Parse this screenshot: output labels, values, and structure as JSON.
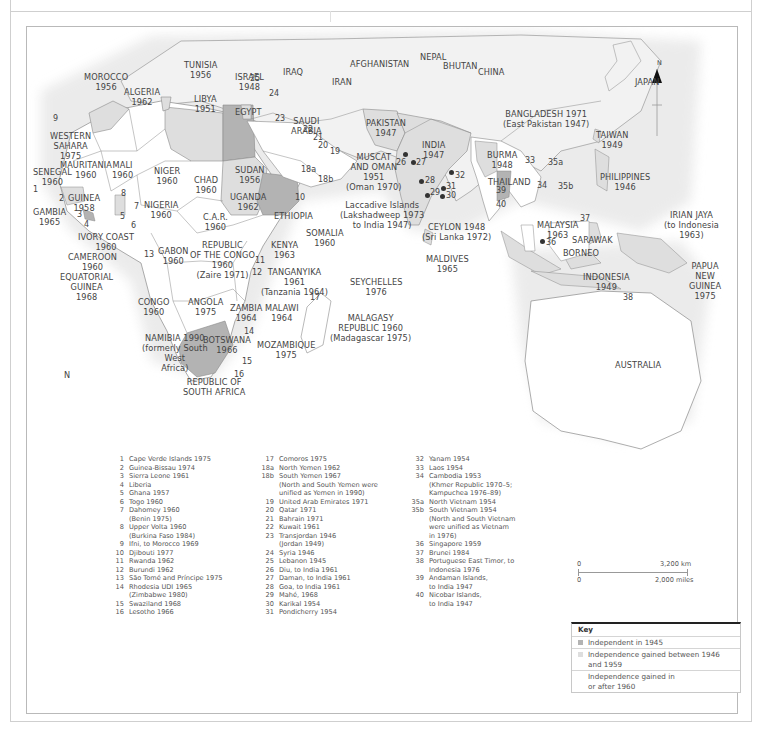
{
  "colors": {
    "independent_1945": "#b3b3b3",
    "independent_1946_1959": "#dedede",
    "independent_1960_after": "#ffffff",
    "sea": "#ffffff",
    "land_other": "#f1f1f1",
    "border": "#8a8a8a"
  },
  "compass": {
    "label": "N",
    "icon": "north-arrow-icon"
  },
  "map_labels": {
    "tunisia": "TUNISIA\n1956",
    "morocco": "MOROCCO\n1956",
    "algeria": "ALGERIA\n1962",
    "libya": "LIBYA\n1951",
    "egypt": "EGYPT",
    "israel": "ISRAEL\n1948",
    "iraq": "IRAQ",
    "iran": "IRAN",
    "afghanistan": "AFGHANISTAN",
    "nepal": "NEPAL",
    "bhutan": "BHUTAN",
    "china": "CHINA",
    "japan": "JAPAN",
    "pakistan": "PAKISTAN\n1947",
    "india": "INDIA\n1947",
    "bangladesh": "BANGLADESH 1971\n(East Pakistan 1947)",
    "taiwan": "TAIWAN\n1949",
    "burma": "BURMA\n1948",
    "thailand": "THAILAND",
    "philippines": "PHILIPPINES\n1946",
    "western_sahara": "WESTERN\nSAHARA\n1975",
    "mauritania": "MAURITANIA\n1960",
    "mali": "MALI\n1960",
    "niger": "NIGER\n1960",
    "chad": "CHAD\n1960",
    "sudan": "SUDAN\n1956",
    "saudi_arabia": "SAUDI\nARABIA",
    "muscat_oman": "MUSCAT\nAND OMAN\n1951\n(Oman 1970)",
    "senegal": "SENEGAL\n1960",
    "gambia": "GAMBIA\n1965",
    "guinea": "GUINEA\n1958",
    "nigeria": "NIGERIA\n1960",
    "uganda": "UGANDA\n1962",
    "ethiopia": "ETHIOPIA",
    "car": "C.A.R.\n1960",
    "ivory_coast": "IVORY COAST\n1960",
    "cameroon": "CAMEROON\n1960",
    "equatorial_guinea": "EQUATORIAL\nGUINEA\n1968",
    "gabon": "GABON\n1960",
    "rep_congo": "REPUBLIC\nOF THE CONGO\n1960\n(Zaire 1971)",
    "somalia": "SOMALIA\n1960",
    "kenya": "KENYA\n1963",
    "tanganyika": "TANGANYIKA\n1961\n(Tanzania 1964)",
    "laccadive": "Laccadive Islands\n(Lakshadweep 1973\nto India 1947)",
    "ceylon": "CEYLON 1948\n(Sri Lanka 1972)",
    "maldives": "MALDIVES\n1965",
    "seychelles": "SEYCHELLES\n1976",
    "malaysia": "MALAYSIA\n1963",
    "sarawak": "SARAWAK",
    "borneo": "BORNEO",
    "irian_jaya": "IRIAN JAYA\n(to Indonesia\n1963)",
    "papua": "PAPUA\nNEW\nGUINEA\n1975",
    "indonesia": "INDONESIA\n1949",
    "congo": "CONGO\n1960",
    "angola": "ANGOLA\n1975",
    "zambia": "ZAMBIA\n1964",
    "malawi": "MALAWI\n1964",
    "malagasy": "MALAGASY\nREPUBLIC 1960\n(Madagascar 1975)",
    "namibia": "NAMIBIA 1990\n(formerly South\nWest\nAfrica)",
    "botswana": "BOTSWANA\n1966",
    "mozambique": "MOZAMBIQUE\n1975",
    "south_africa": "REPUBLIC OF\nSOUTH AFRICA",
    "australia": "AUSTRALIA",
    "ocean_n": "N"
  },
  "map_numbers": [
    "1",
    "2",
    "3",
    "4",
    "5",
    "6",
    "7",
    "8",
    "9",
    "10",
    "11",
    "12",
    "13",
    "14",
    "15",
    "16",
    "17",
    "18a",
    "18b",
    "19",
    "20",
    "21",
    "22",
    "23",
    "24",
    "25",
    "26",
    "27",
    "28",
    "29",
    "30",
    "31",
    "32",
    "33",
    "34",
    "35a",
    "35b",
    "36",
    "37",
    "38",
    "39",
    "40"
  ],
  "footnotes": {
    "col1": [
      {
        "n": "1",
        "t": "Cape Verde Islands 1975"
      },
      {
        "n": "2",
        "t": "Guinea-Bissau 1974"
      },
      {
        "n": "3",
        "t": "Sierra Leone 1961"
      },
      {
        "n": "4",
        "t": "Liberia"
      },
      {
        "n": "5",
        "t": "Ghana 1957"
      },
      {
        "n": "6",
        "t": "Togo 1960"
      },
      {
        "n": "7",
        "t": "Dahomey 1960\n(Benin 1975)"
      },
      {
        "n": "8",
        "t": "Upper Volta 1960\n(Burkina Faso 1984)"
      },
      {
        "n": "9",
        "t": "Ifni, to Morocco 1969"
      },
      {
        "n": "10",
        "t": "Djibouti 1977"
      },
      {
        "n": "11",
        "t": "Rwanda 1962"
      },
      {
        "n": "12",
        "t": "Burundi 1962"
      },
      {
        "n": "13",
        "t": "São Tomé and Príncipe 1975"
      },
      {
        "n": "14",
        "t": "Rhodesia UDI 1965\n(Zimbabwe 1980)"
      },
      {
        "n": "15",
        "t": "Swaziland 1968"
      },
      {
        "n": "16",
        "t": "Lesotho 1966"
      }
    ],
    "col2": [
      {
        "n": "17",
        "t": "Comoros 1975"
      },
      {
        "n": "18a",
        "t": "North Yemen 1962"
      },
      {
        "n": "18b",
        "t": "South Yemen 1967\n(North and South Yemen were\nunified as Yemen in 1990)"
      },
      {
        "n": "19",
        "t": "United Arab Emirates 1971"
      },
      {
        "n": "20",
        "t": "Qatar 1971"
      },
      {
        "n": "21",
        "t": "Bahrain 1971"
      },
      {
        "n": "22",
        "t": "Kuwait 1961"
      },
      {
        "n": "23",
        "t": "Transjordan 1946\n(Jordan 1949)"
      },
      {
        "n": "24",
        "t": "Syria 1946"
      },
      {
        "n": "25",
        "t": "Lebanon 1945"
      },
      {
        "n": "26",
        "t": "Diu, to India 1961"
      },
      {
        "n": "27",
        "t": "Daman, to India 1961"
      },
      {
        "n": "28",
        "t": "Goa, to India 1961"
      },
      {
        "n": "29",
        "t": "Mahé, 1968"
      },
      {
        "n": "30",
        "t": "Karikal 1954"
      },
      {
        "n": "31",
        "t": "Pondicherry 1954"
      }
    ],
    "col3": [
      {
        "n": "32",
        "t": "Yanam 1954"
      },
      {
        "n": "33",
        "t": "Laos 1954"
      },
      {
        "n": "34",
        "t": "Cambodia 1953\n(Khmer Republic 1970–5;\nKampuchea 1976–89)"
      },
      {
        "n": "35a",
        "t": "North Vietnam 1954"
      },
      {
        "n": "35b",
        "t": "South Vietnam 1954\n(North and South Vietnam\nwere unified as Vietnam\nin 1976)"
      },
      {
        "n": "36",
        "t": "Singapore 1959"
      },
      {
        "n": "37",
        "t": "Brunei 1984"
      },
      {
        "n": "38",
        "t": "Portuguese East Timor, to\nIndonesia 1976"
      },
      {
        "n": "39",
        "t": "Andaman Islands,\nto India 1947"
      },
      {
        "n": "40",
        "t": "Nicobar Islands,\nto India 1947"
      }
    ]
  },
  "scale": {
    "km_zero": "0",
    "km_label": "3,200 km",
    "mi_zero": "0",
    "mi_label": "2,000 miles"
  },
  "key": {
    "title": "Key",
    "items": [
      {
        "label": "Independent in 1945",
        "color": "#b3b3b3"
      },
      {
        "label": "Independence gained between 1946\nand 1959",
        "color": "#dedede"
      },
      {
        "label": "Independence gained in\nor after 1960",
        "color": "none"
      }
    ]
  }
}
